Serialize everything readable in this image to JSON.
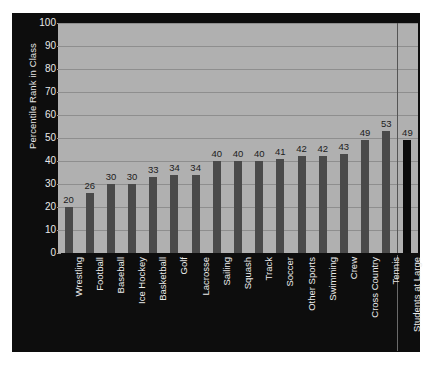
{
  "chart_data": {
    "type": "bar",
    "title": "",
    "xlabel": "",
    "ylabel": "Percentile Rank in Class",
    "ylim": [
      0,
      100
    ],
    "ytick_labels": [
      "0",
      "10",
      "20",
      "30",
      "40",
      "50",
      "60",
      "70",
      "80",
      "90",
      "100"
    ],
    "ytick_values": [
      0,
      10,
      20,
      30,
      40,
      50,
      60,
      70,
      80,
      90,
      100
    ],
    "grid": true,
    "legend": "none",
    "categories": [
      "Wrestling",
      "Football",
      "Baseball",
      "Ice Hockey",
      "Basketball",
      "Golf",
      "Lacrosse",
      "Sailing",
      "Squash",
      "Track",
      "Soccer",
      "Other Sports",
      "Swimming",
      "Crew",
      "Cross Country",
      "Tennis",
      "Students at Large"
    ],
    "values": [
      20,
      26,
      30,
      30,
      33,
      34,
      34,
      40,
      40,
      40,
      41,
      42,
      42,
      43,
      49,
      53,
      49
    ],
    "data_labels": [
      "20",
      "26",
      "30",
      "30",
      "33",
      "34",
      "34",
      "40",
      "40",
      "40",
      "41",
      "42",
      "42",
      "43",
      "49",
      "53",
      "49"
    ],
    "highlight_index": 16,
    "divider_after_index": 15,
    "colors": {
      "figure_background": "#0d0d0d",
      "plot_background": "#b0b0b0",
      "gridline": "#8e8e8e",
      "bar": "#4a4a4a",
      "bar_highlight": "#0a0a0a",
      "tick_text": "#e9e9e9",
      "data_label_text": "#1c1c1c",
      "category_label_text": "#ececec",
      "divider": "#555555"
    }
  }
}
